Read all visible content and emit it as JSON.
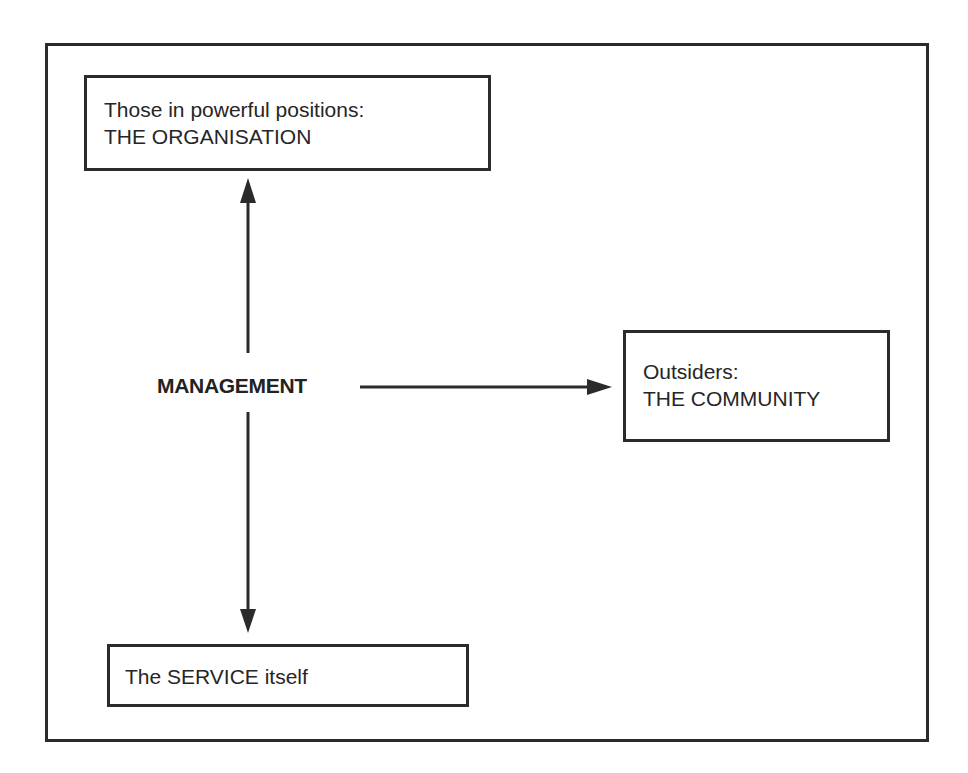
{
  "diagram": {
    "type": "relationship-diagram",
    "center": {
      "label": "MANAGEMENT"
    },
    "nodes": {
      "organisation": {
        "line1": "Those in powerful positions:",
        "line2": "THE ORGANISATION",
        "position": "top"
      },
      "community": {
        "line1": "Outsiders:",
        "line2": "THE COMMUNITY",
        "position": "right"
      },
      "service": {
        "line1": "The SERVICE itself",
        "position": "bottom"
      }
    },
    "edges": [
      {
        "from": "MANAGEMENT",
        "to": "organisation",
        "direction": "up",
        "icon": "arrow-up-icon"
      },
      {
        "from": "MANAGEMENT",
        "to": "community",
        "direction": "right",
        "icon": "arrow-right-icon"
      },
      {
        "from": "MANAGEMENT",
        "to": "service",
        "direction": "down",
        "icon": "arrow-down-icon"
      }
    ],
    "colors": {
      "stroke": "#2b2b2b",
      "text": "#262626",
      "background": "#ffffff"
    }
  }
}
